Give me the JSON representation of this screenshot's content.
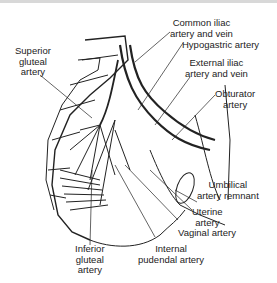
{
  "figure": {
    "labels": {
      "common_iliac": [
        "Common iliac",
        "artery and vein"
      ],
      "hypogastric": [
        "Hypogastric artery"
      ],
      "superior_gluteal": [
        "Superior",
        "gluteal",
        "artery"
      ],
      "external_iliac": [
        "External iliac",
        "artery and vein"
      ],
      "obturator": [
        "Obturator",
        "artery"
      ],
      "umbilical": [
        "Umbilical",
        "artery remnant"
      ],
      "uterine": [
        "Uterine",
        "artery"
      ],
      "vaginal": [
        "Vaginal artery"
      ],
      "inferior_gluteal": [
        "Inferior",
        "gluteal",
        "artery"
      ],
      "internal_pudendal": [
        "Internal",
        "pudendal artery"
      ]
    }
  }
}
